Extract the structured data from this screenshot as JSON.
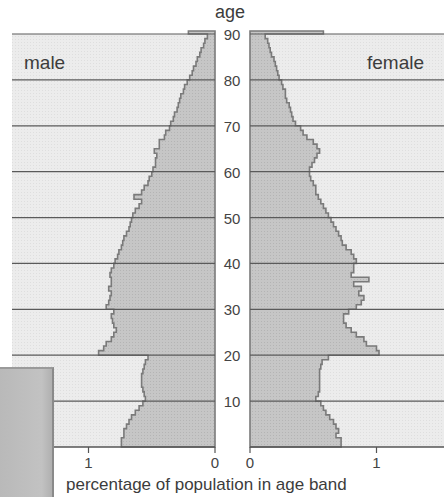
{
  "chart_data": {
    "type": "bar",
    "subtype": "population-pyramid",
    "title": "",
    "ylabel": "age",
    "xlabel": "percentage of population in age band",
    "left_panel_label": "male",
    "right_panel_label": "female",
    "age_ticks": [
      10,
      20,
      30,
      40,
      50,
      60,
      70,
      80,
      90
    ],
    "x_ticks_male": [
      {
        "value": 1,
        "label": "1"
      },
      {
        "value": 0,
        "label": "0"
      }
    ],
    "x_ticks_female": [
      {
        "value": 0,
        "label": "0"
      },
      {
        "value": 1,
        "label": "1"
      }
    ],
    "xlim": [
      0,
      1.35
    ],
    "ylim": [
      0,
      90
    ],
    "grid": "horizontal at every 10 years",
    "colors": {
      "bar_fill": "#c4c4c4",
      "bar_outline": "#7a7a7a",
      "panel_background": "#ececec",
      "grid_line": "#5a5a5a"
    },
    "ages": [
      0,
      1,
      2,
      3,
      4,
      5,
      6,
      7,
      8,
      9,
      10,
      11,
      12,
      13,
      14,
      15,
      16,
      17,
      18,
      19,
      20,
      21,
      22,
      23,
      24,
      25,
      26,
      27,
      28,
      29,
      30,
      31,
      32,
      33,
      34,
      35,
      36,
      37,
      38,
      39,
      40,
      41,
      42,
      43,
      44,
      45,
      46,
      47,
      48,
      49,
      50,
      51,
      52,
      53,
      54,
      55,
      56,
      57,
      58,
      59,
      60,
      61,
      62,
      63,
      64,
      65,
      66,
      67,
      68,
      69,
      70,
      71,
      72,
      73,
      74,
      75,
      76,
      77,
      78,
      79,
      80,
      81,
      82,
      83,
      84,
      85,
      86,
      87,
      88,
      89,
      90
    ],
    "series": [
      {
        "name": "male",
        "values": [
          0.74,
          0.74,
          0.72,
          0.72,
          0.7,
          0.68,
          0.66,
          0.63,
          0.6,
          0.57,
          0.55,
          0.56,
          0.57,
          0.58,
          0.58,
          0.58,
          0.57,
          0.56,
          0.55,
          0.53,
          0.92,
          0.88,
          0.86,
          0.82,
          0.8,
          0.78,
          0.8,
          0.81,
          0.82,
          0.8,
          0.86,
          0.84,
          0.83,
          0.82,
          0.84,
          0.82,
          0.82,
          0.83,
          0.82,
          0.8,
          0.79,
          0.77,
          0.76,
          0.74,
          0.73,
          0.72,
          0.7,
          0.68,
          0.67,
          0.66,
          0.65,
          0.63,
          0.6,
          0.58,
          0.64,
          0.58,
          0.56,
          0.53,
          0.52,
          0.5,
          0.49,
          0.47,
          0.47,
          0.46,
          0.48,
          0.44,
          0.44,
          0.4,
          0.39,
          0.36,
          0.35,
          0.33,
          0.32,
          0.3,
          0.29,
          0.28,
          0.27,
          0.25,
          0.24,
          0.22,
          0.2,
          0.18,
          0.17,
          0.15,
          0.14,
          0.12,
          0.11,
          0.09,
          0.08,
          0.06,
          0.21
        ]
      },
      {
        "name": "female",
        "values": [
          0.72,
          0.72,
          0.68,
          0.7,
          0.68,
          0.66,
          0.63,
          0.6,
          0.58,
          0.56,
          0.52,
          0.54,
          0.55,
          0.55,
          0.55,
          0.55,
          0.55,
          0.56,
          0.57,
          0.62,
          1.02,
          1.0,
          0.92,
          0.9,
          0.84,
          0.8,
          0.76,
          0.74,
          0.74,
          0.78,
          0.84,
          0.88,
          0.9,
          0.86,
          0.88,
          0.82,
          0.94,
          0.8,
          0.82,
          0.82,
          0.84,
          0.82,
          0.8,
          0.76,
          0.73,
          0.72,
          0.7,
          0.68,
          0.66,
          0.64,
          0.62,
          0.6,
          0.58,
          0.56,
          0.54,
          0.52,
          0.52,
          0.5,
          0.48,
          0.47,
          0.47,
          0.49,
          0.51,
          0.53,
          0.55,
          0.53,
          0.5,
          0.45,
          0.42,
          0.4,
          0.36,
          0.34,
          0.33,
          0.32,
          0.31,
          0.29,
          0.28,
          0.28,
          0.26,
          0.25,
          0.23,
          0.22,
          0.21,
          0.2,
          0.19,
          0.17,
          0.16,
          0.15,
          0.14,
          0.12,
          0.58
        ]
      }
    ]
  }
}
